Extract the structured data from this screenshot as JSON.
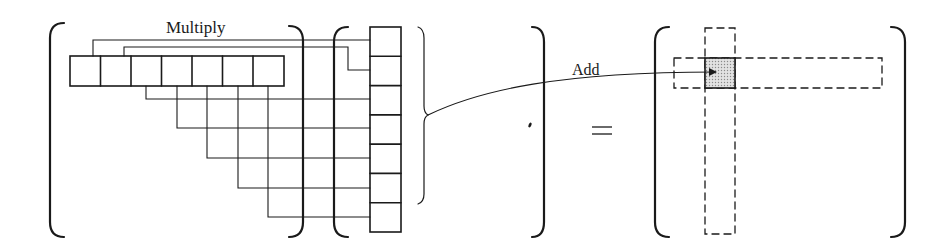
{
  "labels": {
    "multiply": "Multiply",
    "add": "Add",
    "equals": "="
  },
  "structure": {
    "row_vector_cells": 7,
    "column_vector_cells": 7,
    "result_highlight": "single shaded cell at intersection of dashed row and dashed column"
  },
  "colors": {
    "ink": "#1a1a1a",
    "shade": "#c8c8c8",
    "background": "#ffffff"
  }
}
